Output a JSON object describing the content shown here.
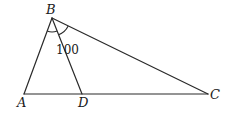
{
  "figure": {
    "type": "triangle-diagram",
    "points": {
      "A": {
        "label": "A",
        "x": 24,
        "y": 94
      },
      "B": {
        "label": "B",
        "x": 52,
        "y": 18
      },
      "C": {
        "label": "C",
        "x": 208,
        "y": 94
      },
      "D": {
        "label": "D",
        "x": 82,
        "y": 94
      }
    },
    "segments": [
      "AB",
      "BC",
      "AC",
      "BD"
    ],
    "angle_marks": [
      {
        "vertex": "B",
        "between": [
          "BA",
          "BD"
        ]
      },
      {
        "vertex": "B",
        "between": [
          "BD",
          "BC"
        ]
      }
    ],
    "angle_label": "100",
    "colors": {
      "stroke": "#2a2a2a",
      "text": "#1a1a1a",
      "background": "#ffffff"
    }
  }
}
